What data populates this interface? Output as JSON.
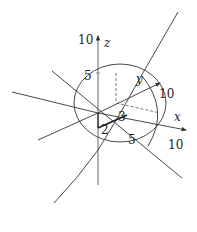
{
  "diagram": {
    "type": "3d-axes-with-curves",
    "stroke_color": "#333333",
    "background": "#ffffff",
    "axes": {
      "z": {
        "label": "z",
        "tick_labels": [
          "5",
          "10"
        ]
      },
      "y": {
        "label": "y",
        "tick_labels": [
          "10"
        ]
      },
      "x": {
        "label": "x",
        "tick_labels": [
          "5",
          "10"
        ]
      }
    },
    "point_labels": {
      "a": "2",
      "b": "3"
    },
    "labels": {
      "z_10": "10",
      "z_axis": "z",
      "z_5": "5",
      "y_axis": "y",
      "y_10": "10",
      "x_axis": "x",
      "x_5": "5",
      "x_10": "10",
      "seg_2": "2",
      "seg_3": "3"
    }
  }
}
